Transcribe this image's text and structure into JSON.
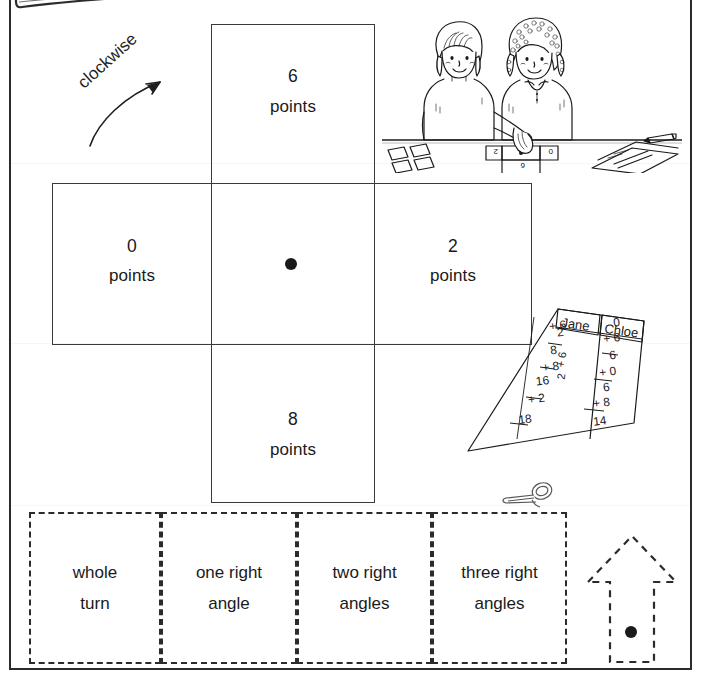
{
  "worksheet": {
    "title_box": "hand-drawn-header-box",
    "rotation_label": "clockwise"
  },
  "spinner_grid": {
    "center_dot": "pivot-dot",
    "cells": [
      {
        "position": "top",
        "number": "6",
        "unit": "points"
      },
      {
        "position": "left",
        "number": "0",
        "unit": "points"
      },
      {
        "position": "center",
        "number": "",
        "unit": ""
      },
      {
        "position": "right",
        "number": "2",
        "unit": "points"
      },
      {
        "position": "bottom",
        "number": "8",
        "unit": "points"
      }
    ]
  },
  "illustration": {
    "name": "two-children-at-table-illustration",
    "elements": [
      "girl-left",
      "girl-right",
      "table",
      "paper-cards",
      "cross-spinner",
      "worksheet-paper",
      "pencil"
    ],
    "spinner_card_values": [
      "2",
      "0",
      "6"
    ]
  },
  "score_sheet": {
    "name": "score-sheet-illustration",
    "columns": [
      "Jane",
      "Chloe"
    ],
    "jane_sums": [
      "+ 6",
      "2",
      "8",
      "+ 8",
      "16",
      "+ 2",
      "18"
    ],
    "jane_total": "18",
    "chloe_sums": [
      "0",
      "+ 6",
      "6",
      "+ 0",
      "6",
      "+ 8",
      "14"
    ],
    "chloe_total": "14"
  },
  "word_cards": [
    {
      "line1": "whole",
      "line2": "turn"
    },
    {
      "line1": "one right",
      "line2": "angle"
    },
    {
      "line1": "two right",
      "line2": "angles"
    },
    {
      "line1": "three right",
      "line2": "angles"
    }
  ],
  "arrow_shape": {
    "name": "dashed-up-arrow-with-pivot-dot"
  },
  "icons": {
    "scissors": "scissors-icon"
  },
  "colors": {
    "ink": "#1a1a1a",
    "frame": "#2b2b2b",
    "grid_line": "#3a3a3a",
    "paper": "#ffffff"
  }
}
